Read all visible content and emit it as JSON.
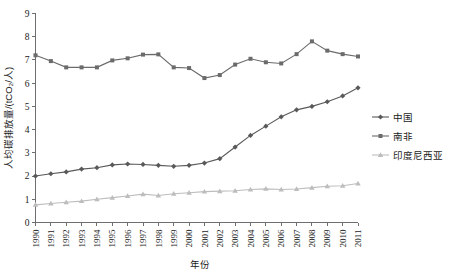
{
  "chart_data": {
    "type": "line",
    "title": "",
    "xlabel": "年份",
    "ylabel": "人均碳排放量/(tCO₂/人)",
    "xlim": [
      1990,
      2011
    ],
    "ylim": [
      0,
      9
    ],
    "ytick_step": 1,
    "grid": false,
    "legend_position": "right",
    "categories": [
      "1990",
      "1991",
      "1992",
      "1993",
      "1994",
      "1995",
      "1996",
      "1997",
      "1998",
      "1999",
      "2000",
      "2001",
      "2002",
      "2003",
      "2004",
      "2005",
      "2006",
      "2007",
      "2008",
      "2009",
      "2010",
      "2011"
    ],
    "yticks": [
      "0",
      "1",
      "2",
      "3",
      "4",
      "5",
      "6",
      "7",
      "8",
      "9"
    ],
    "series": [
      {
        "name": "中国",
        "marker": "diamond",
        "color": "#595959",
        "values": [
          2.0,
          2.1,
          2.18,
          2.3,
          2.36,
          2.48,
          2.52,
          2.5,
          2.46,
          2.42,
          2.46,
          2.56,
          2.75,
          3.25,
          3.75,
          4.15,
          4.55,
          4.85,
          5.0,
          5.2,
          5.45,
          5.8
        ]
      },
      {
        "name": "南非",
        "marker": "square",
        "color": "#6b6b6b",
        "values": [
          7.2,
          6.95,
          6.68,
          6.68,
          6.68,
          6.98,
          7.07,
          7.23,
          7.24,
          6.68,
          6.65,
          6.22,
          6.35,
          6.8,
          7.05,
          6.9,
          6.85,
          7.25,
          7.8,
          7.4,
          7.25,
          7.15
        ]
      },
      {
        "name": "印度尼西亚",
        "marker": "triangle",
        "color": "#bdbdbd",
        "values": [
          0.76,
          0.82,
          0.87,
          0.92,
          1.0,
          1.07,
          1.14,
          1.22,
          1.16,
          1.24,
          1.28,
          1.33,
          1.35,
          1.37,
          1.42,
          1.45,
          1.42,
          1.44,
          1.5,
          1.56,
          1.58,
          1.68
        ]
      }
    ]
  },
  "legend": {
    "items": [
      {
        "label": "中国"
      },
      {
        "label": "南非"
      },
      {
        "label": "印度尼西亚"
      }
    ]
  }
}
